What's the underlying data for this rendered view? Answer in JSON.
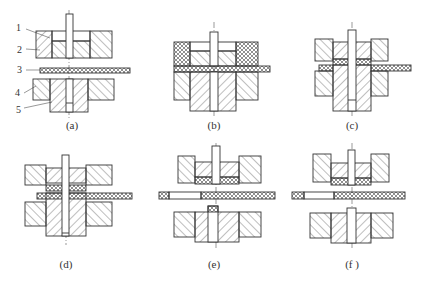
{
  "diagram": {
    "panels": [
      {
        "id": "a",
        "caption": "(a)"
      },
      {
        "id": "b",
        "caption": "(b)"
      },
      {
        "id": "c",
        "caption": "(c)"
      },
      {
        "id": "d",
        "caption": "(d)"
      },
      {
        "id": "e",
        "caption": "(e)"
      },
      {
        "id": "f",
        "caption": "(f )"
      }
    ],
    "part_numbers": [
      "1",
      "2",
      "3",
      "4",
      "5"
    ],
    "colors": {
      "line": "#333333",
      "background": "#ffffff"
    }
  }
}
